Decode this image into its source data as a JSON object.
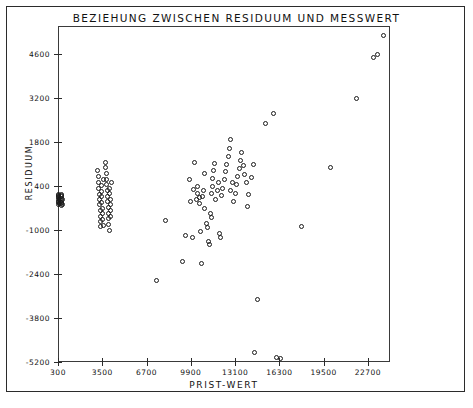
{
  "chart_data": {
    "type": "scatter",
    "title": "BEZIEHUNG ZWISCHEN RESIDUUM UND MESSWERT",
    "xlabel": "PRIST-WERT",
    "ylabel": "RESIDUUM",
    "grid": false,
    "legend": null,
    "xlim": [
      300,
      24300
    ],
    "ylim": [
      -5200,
      5500
    ],
    "xticks": [
      300,
      3500,
      6700,
      9900,
      13100,
      16300,
      19500,
      22700
    ],
    "xtick_labels": [
      "300",
      "3500",
      "6700",
      "9900",
      "13100",
      "16300",
      "19500",
      "22700"
    ],
    "yticks": [
      4600,
      3200,
      1800,
      400,
      -1000,
      -2400,
      -3800,
      -5200
    ],
    "ytick_labels": [
      "4600",
      "3200",
      "1800",
      "400",
      "-1000",
      "-2400",
      "-3800",
      "-5200"
    ],
    "marker": "open-circle",
    "marker_color": "#1a1a1a",
    "points": [
      [
        330,
        120
      ],
      [
        340,
        60
      ],
      [
        345,
        -40
      ],
      [
        350,
        -120
      ],
      [
        355,
        -200
      ],
      [
        360,
        30
      ],
      [
        365,
        -90
      ],
      [
        370,
        100
      ],
      [
        375,
        -160
      ],
      [
        380,
        -10
      ],
      [
        520,
        150
      ],
      [
        540,
        60
      ],
      [
        545,
        -50
      ],
      [
        550,
        -140
      ],
      [
        560,
        -230
      ],
      [
        565,
        20
      ],
      [
        570,
        -110
      ],
      [
        580,
        90
      ],
      [
        590,
        -180
      ],
      [
        600,
        -30
      ],
      [
        3150,
        900
      ],
      [
        3200,
        700
      ],
      [
        3230,
        520
      ],
      [
        3260,
        330
      ],
      [
        3280,
        150
      ],
      [
        3300,
        -20
      ],
      [
        3320,
        -200
      ],
      [
        3340,
        -380
      ],
      [
        3360,
        -560
      ],
      [
        3380,
        -720
      ],
      [
        3400,
        -880
      ],
      [
        3420,
        420
      ],
      [
        3440,
        240
      ],
      [
        3460,
        60
      ],
      [
        3480,
        -120
      ],
      [
        3500,
        -300
      ],
      [
        3520,
        -480
      ],
      [
        3540,
        -660
      ],
      [
        3560,
        -840
      ],
      [
        3580,
        600
      ],
      [
        3700,
        1150
      ],
      [
        3760,
        980
      ],
      [
        3800,
        800
      ],
      [
        3820,
        620
      ],
      [
        3840,
        440
      ],
      [
        3860,
        260
      ],
      [
        3880,
        80
      ],
      [
        3900,
        -100
      ],
      [
        3920,
        -280
      ],
      [
        3940,
        -460
      ],
      [
        3960,
        -640
      ],
      [
        3980,
        -820
      ],
      [
        4000,
        -1000
      ],
      [
        4020,
        340
      ],
      [
        4040,
        160
      ],
      [
        4060,
        -20
      ],
      [
        4080,
        -200
      ],
      [
        4100,
        -380
      ],
      [
        4120,
        -560
      ],
      [
        4140,
        520
      ],
      [
        7400,
        -2600
      ],
      [
        8100,
        -680
      ],
      [
        9300,
        -2000
      ],
      [
        9500,
        -1180
      ],
      [
        9800,
        600
      ],
      [
        9900,
        -100
      ],
      [
        10050,
        -1250
      ],
      [
        10100,
        300
      ],
      [
        10200,
        1150
      ],
      [
        10300,
        -40
      ],
      [
        10350,
        170
      ],
      [
        10420,
        380
      ],
      [
        10500,
        30
      ],
      [
        10560,
        -160
      ],
      [
        10600,
        -1050
      ],
      [
        10700,
        -2050
      ],
      [
        10750,
        60
      ],
      [
        10800,
        250
      ],
      [
        10860,
        -300
      ],
      [
        10900,
        800
      ],
      [
        11000,
        -800
      ],
      [
        11100,
        -920
      ],
      [
        11200,
        -1350
      ],
      [
        11250,
        -1450
      ],
      [
        11300,
        -480
      ],
      [
        11380,
        -600
      ],
      [
        11400,
        170
      ],
      [
        11450,
        400
      ],
      [
        11500,
        640
      ],
      [
        11550,
        900
      ],
      [
        11600,
        1120
      ],
      [
        11700,
        -40
      ],
      [
        11800,
        260
      ],
      [
        11900,
        520
      ],
      [
        12000,
        -1100
      ],
      [
        12050,
        -1250
      ],
      [
        12100,
        100
      ],
      [
        12200,
        330
      ],
      [
        12300,
        600
      ],
      [
        12400,
        860
      ],
      [
        12500,
        1080
      ],
      [
        12600,
        1350
      ],
      [
        12700,
        1600
      ],
      [
        12750,
        1900
      ],
      [
        12800,
        260
      ],
      [
        12900,
        520
      ],
      [
        13000,
        -80
      ],
      [
        13100,
        180
      ],
      [
        13200,
        450
      ],
      [
        13300,
        700
      ],
      [
        13400,
        960
      ],
      [
        13500,
        1220
      ],
      [
        13600,
        1460
      ],
      [
        13700,
        1050
      ],
      [
        13800,
        780
      ],
      [
        13900,
        520
      ],
      [
        14000,
        -250
      ],
      [
        14100,
        120
      ],
      [
        14300,
        680
      ],
      [
        14400,
        1100
      ],
      [
        14500,
        -4900
      ],
      [
        14700,
        -3200
      ],
      [
        15300,
        2400
      ],
      [
        15900,
        2700
      ],
      [
        16100,
        -5050
      ],
      [
        16400,
        -5100
      ],
      [
        17900,
        -900
      ],
      [
        20000,
        1000
      ],
      [
        21900,
        3200
      ],
      [
        23100,
        4500
      ],
      [
        23400,
        4600
      ],
      [
        23800,
        5200
      ]
    ]
  }
}
